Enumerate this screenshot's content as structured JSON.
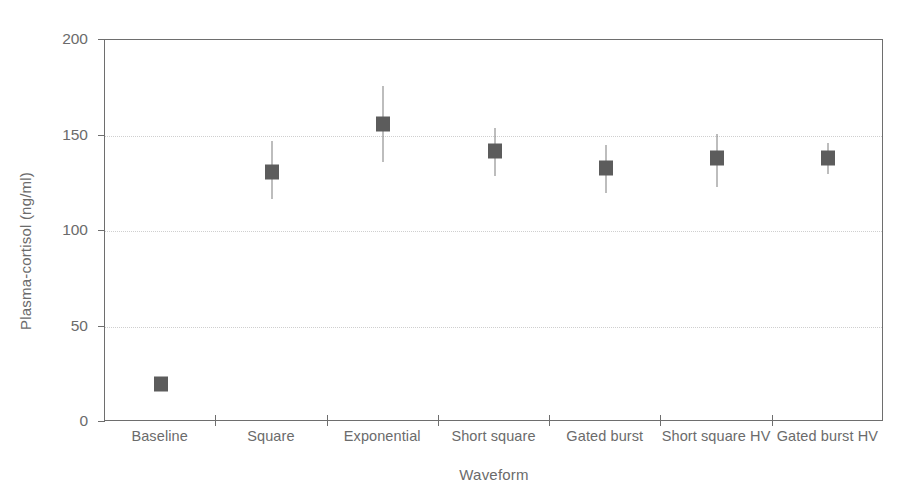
{
  "chart_data": {
    "type": "scatter",
    "title": "",
    "xlabel": "Waveform",
    "ylabel": "Plasma-cortisol (ng/ml)",
    "categories": [
      "Baseline",
      "Square",
      "Exponential",
      "Short square",
      "Gated burst",
      "Short square HV",
      "Gated burst HV"
    ],
    "values": [
      20,
      131,
      156,
      142,
      133,
      138,
      138
    ],
    "error_low": [
      20,
      117,
      136,
      129,
      120,
      123,
      130
    ],
    "error_high": [
      20,
      147,
      176,
      154,
      145,
      151,
      146
    ],
    "ylim": [
      0,
      200
    ],
    "yticks": [
      0,
      50,
      100,
      150,
      200
    ],
    "ytick_labels": [
      "0",
      "50",
      "100",
      "150",
      "200"
    ],
    "gridlines_y": [
      50,
      100,
      150
    ],
    "grid": true,
    "legend": "none",
    "marker_color": "#5c5c5c",
    "errorbar_color": "#7d7d7d",
    "axis_color": "#6e6e6e",
    "grid_color": "#cfcfcf",
    "text_color": "#6b6b6b"
  }
}
